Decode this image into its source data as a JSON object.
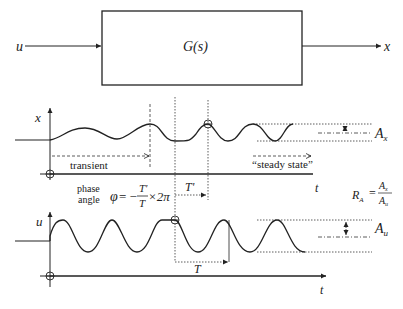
{
  "block_diagram": {
    "input_label": "u",
    "block_label": "G(s)",
    "output_label": "x"
  },
  "output_plot": {
    "y_axis_label": "x",
    "x_axis_label": "t",
    "transient_label": "transient",
    "steady_state_label": "“steady state”",
    "amplitude_label": "A",
    "amplitude_sub": "x",
    "period_shift_label": "T'"
  },
  "phase": {
    "label_line1": "phase",
    "label_line2": "angle",
    "phi": "φ",
    "equals_minus": "= −",
    "numerator": "T'",
    "denominator": "T",
    "times_2pi": "×2π"
  },
  "ratio": {
    "lhs": "R",
    "lhs_sub": "A",
    "equals": "=",
    "numerator": "A",
    "numerator_sub": "x",
    "denominator": "A",
    "denominator_sub": "u"
  },
  "input_plot": {
    "y_axis_label": "u",
    "x_axis_label": "t",
    "amplitude_label": "A",
    "amplitude_sub": "u",
    "period_label": "T"
  }
}
